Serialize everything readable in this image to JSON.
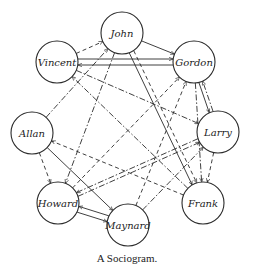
{
  "caption": "A Sociogram.",
  "colors": {
    "line": "#2a2a2a",
    "node_fill": "#ffffff",
    "background": "#ffffff"
  },
  "nodes": [
    {
      "id": "john",
      "label": "John",
      "x": 122,
      "y": 33,
      "r": 21
    },
    {
      "id": "vincent",
      "label": "Vincent",
      "x": 57,
      "y": 62,
      "r": 21
    },
    {
      "id": "gordon",
      "label": "Gordon",
      "x": 194,
      "y": 62,
      "r": 21
    },
    {
      "id": "allan",
      "label": "Allan",
      "x": 32,
      "y": 133,
      "r": 21
    },
    {
      "id": "larry",
      "label": "Larry",
      "x": 218,
      "y": 132,
      "r": 21
    },
    {
      "id": "howard",
      "label": "Howard",
      "x": 58,
      "y": 203,
      "r": 21
    },
    {
      "id": "frank",
      "label": "Frank",
      "x": 203,
      "y": 203,
      "r": 21
    },
    {
      "id": "maynard",
      "label": "Maynard",
      "x": 128,
      "y": 225,
      "r": 21
    }
  ],
  "edges": [
    {
      "from": "john",
      "to": "gordon",
      "style": "solid"
    },
    {
      "from": "vincent",
      "to": "john",
      "style": "dashed"
    },
    {
      "from": "vincent",
      "to": "gordon",
      "style": "solid",
      "offset": -3
    },
    {
      "from": "gordon",
      "to": "vincent",
      "style": "solid",
      "offset": -3
    },
    {
      "from": "vincent",
      "to": "larry",
      "style": "dashdot"
    },
    {
      "from": "allan",
      "to": "john",
      "style": "dashdot"
    },
    {
      "from": "allan",
      "to": "howard",
      "style": "dashed"
    },
    {
      "from": "allan",
      "to": "maynard",
      "style": "solid"
    },
    {
      "from": "frank",
      "to": "allan",
      "style": "dashed"
    },
    {
      "from": "john",
      "to": "howard",
      "style": "dashdot"
    },
    {
      "from": "john",
      "to": "frank",
      "style": "solid",
      "offset": 2
    },
    {
      "from": "john",
      "to": "frank",
      "style": "dashed",
      "offset": -3
    },
    {
      "from": "gordon",
      "to": "larry",
      "style": "solid",
      "offset": 2
    },
    {
      "from": "larry",
      "to": "gordon",
      "style": "dashdot",
      "offset": 2
    },
    {
      "from": "gordon",
      "to": "frank",
      "style": "dashdot"
    },
    {
      "from": "maynard",
      "to": "gordon",
      "style": "dashed"
    },
    {
      "from": "howard",
      "to": "gordon",
      "style": "dashed"
    },
    {
      "from": "howard",
      "to": "larry",
      "style": "dashdot",
      "offset": 2
    },
    {
      "from": "larry",
      "to": "howard",
      "style": "dashdot",
      "offset": 2
    },
    {
      "from": "larry",
      "to": "frank",
      "style": "dashed"
    },
    {
      "from": "maynard",
      "to": "larry",
      "style": "dashdot"
    },
    {
      "from": "howard",
      "to": "maynard",
      "style": "solid",
      "offset": 3
    },
    {
      "from": "maynard",
      "to": "howard",
      "style": "solid",
      "offset": 3
    },
    {
      "from": "frank",
      "to": "vincent",
      "style": "dashdot"
    }
  ]
}
